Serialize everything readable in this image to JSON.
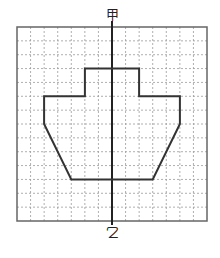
{
  "labels": {
    "top": "甲",
    "bottom": "乙"
  },
  "grid": {
    "left": 17,
    "top": 27,
    "right": 207,
    "bottom": 221,
    "cols": 14,
    "rows": 14,
    "axis_col": 7
  },
  "shape": {
    "description": "Symmetric ship-like outline drawn on grid paper, axis of symmetry vertical",
    "points_grid": [
      [
        5,
        3
      ],
      [
        9,
        3
      ],
      [
        9,
        5
      ],
      [
        12,
        5
      ],
      [
        12,
        7
      ],
      [
        10,
        11
      ],
      [
        4,
        11
      ],
      [
        2,
        7
      ],
      [
        2,
        5
      ],
      [
        5,
        5
      ]
    ]
  },
  "colors": {
    "border": "#666666",
    "grid": "#9a9a9a",
    "axis": "#222222",
    "shape": "#333333"
  }
}
